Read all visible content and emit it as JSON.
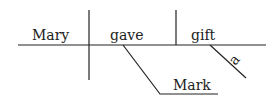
{
  "diagram": {
    "type": "sentence-diagram",
    "subject": "Mary",
    "verb": "gave",
    "direct_object": "gift",
    "indirect_object": "Mark",
    "modifier": "a"
  }
}
